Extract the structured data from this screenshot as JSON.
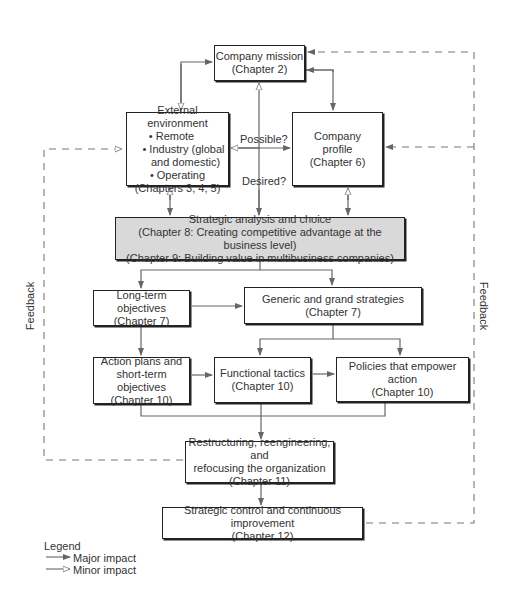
{
  "diagram": {
    "nodes": {
      "mission": {
        "title": "Company mission",
        "chapter": "(Chapter 2)"
      },
      "external": {
        "title": "External environment",
        "bullets": [
          "• Remote",
          "• Industry (global",
          "and domestic)",
          "• Operating"
        ],
        "chapter": "(Chapters 3, 4, 5)"
      },
      "profile": {
        "line1": "Company",
        "line2": "profile",
        "chapter": "(Chapter 6)"
      },
      "analysis": {
        "title": "Strategic analysis and choice",
        "line2": "(Chapter 8: Creating competitive advantage at the business level)",
        "line3": "(Chapter 9: Building value in multibusiness companies)"
      },
      "longterm": {
        "title": "Long-term objectives",
        "chapter": "(Chapter 7)"
      },
      "generic": {
        "title": "Generic and grand strategies",
        "chapter": "(Chapter 7)"
      },
      "action": {
        "line1": "Action plans and",
        "line2": "short-term objectives",
        "chapter": "(Chapter 10)"
      },
      "functional": {
        "title": "Functional tactics",
        "chapter": "(Chapter 10)"
      },
      "policies": {
        "title": "Policies that empower action",
        "chapter": "(Chapter 10)"
      },
      "restructuring": {
        "line1": "Restructuring, reengineering, and",
        "line2": "refocusing the organization",
        "chapter": "(Chapter 11)"
      },
      "control": {
        "title": "Strategic control and continuous improvement",
        "chapter": "(Chapter 12)"
      }
    },
    "labels": {
      "possible": "Possible?",
      "desired": "Desired?",
      "feedback_left": "Feedback",
      "feedback_right": "Feedback"
    },
    "legend": {
      "title": "Legend",
      "major": "Major impact",
      "minor": "Minor impact"
    },
    "colors": {
      "line": "#666666",
      "border": "#222222",
      "shaded_fill": "#d9d9d9"
    }
  }
}
